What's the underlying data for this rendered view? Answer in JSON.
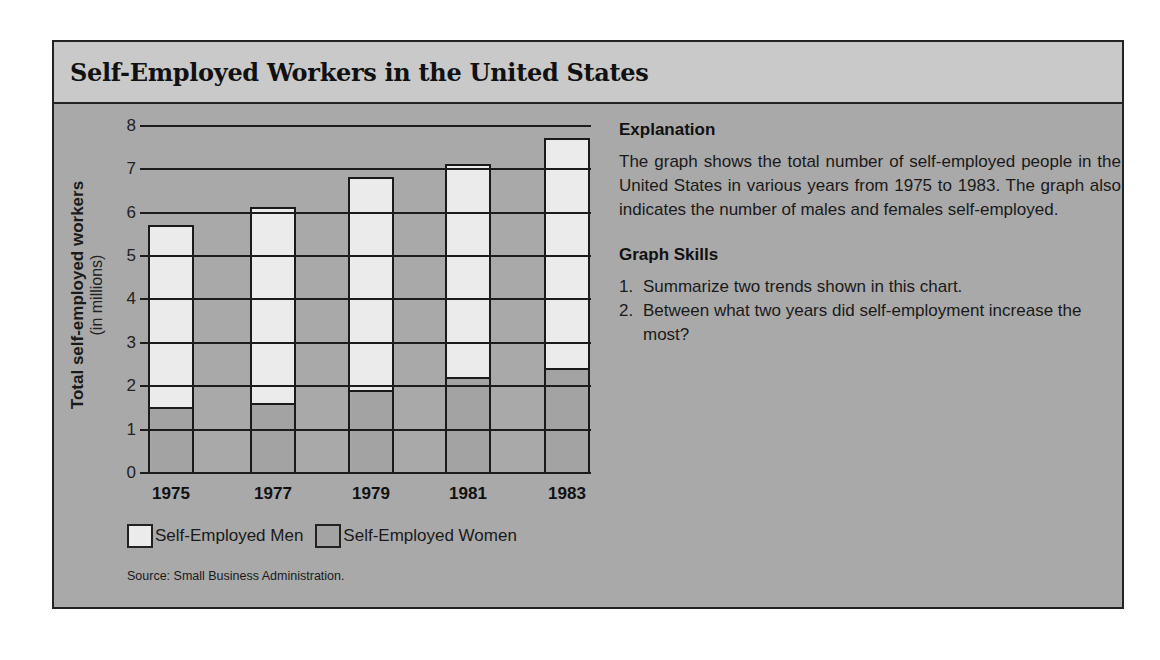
{
  "title": "Self-Employed Workers in the United States",
  "colors": {
    "panel_bg": "#a9a9a9",
    "title_band_bg": "#c9c9c9",
    "men_fill": "#ebebeb",
    "women_fill": "#a3a3a3",
    "line": "#1c1c1c"
  },
  "chart_data": {
    "type": "bar",
    "stacked": true,
    "title": "Self-Employed Workers in the United States",
    "categories": [
      "1975",
      "1977",
      "1979",
      "1981",
      "1983"
    ],
    "series": [
      {
        "name": "Self-Employed Women",
        "values": [
          1.5,
          1.6,
          1.9,
          2.2,
          2.4
        ]
      },
      {
        "name": "Self-Employed Men",
        "values": [
          4.2,
          4.5,
          4.9,
          4.9,
          5.3
        ]
      }
    ],
    "totals": [
      5.7,
      6.1,
      6.8,
      7.1,
      7.7
    ],
    "xlabel": "",
    "ylabel": "Total self-employed workers",
    "ylabel_sub": "(in millions)",
    "ylim": [
      0,
      8
    ],
    "yticks": [
      "0",
      "1",
      "2",
      "3",
      "4",
      "5",
      "6",
      "7",
      "8"
    ],
    "grid": true,
    "legend_position": "bottom",
    "source": "Source: Small Business Administration."
  },
  "legend": [
    {
      "label": "Self-Employed Men",
      "swatch": "men"
    },
    {
      "label": "Self-Employed Women",
      "swatch": "women"
    }
  ],
  "source": "Source: Small Business Administration.",
  "explanation": {
    "heading": "Explanation",
    "text": "The graph shows the total number of self-employed people in the United States in various years from 1975 to 1983. The graph also indicates the number of males and females self-employed."
  },
  "graph_skills": {
    "heading": "Graph Skills",
    "items": [
      {
        "num": "1.",
        "text": "Summarize two trends shown in this chart."
      },
      {
        "num": "2.",
        "text": "Between what two years did self-employment increase the most?"
      }
    ]
  }
}
